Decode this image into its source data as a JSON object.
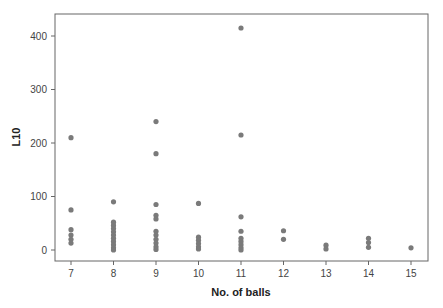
{
  "chart_data": {
    "type": "scatter",
    "title": "",
    "xlabel": "No. of balls",
    "ylabel": "L10",
    "xlim": [
      6.6,
      15.4
    ],
    "ylim": [
      -20,
      440
    ],
    "x_ticks": [
      7,
      8,
      9,
      10,
      11,
      12,
      13,
      14,
      15
    ],
    "y_ticks": [
      0,
      100,
      200,
      300,
      400
    ],
    "grid": false,
    "legend": null,
    "marker_color": "#7a7a7a",
    "series": [
      {
        "name": "L10",
        "points": [
          {
            "x": 7,
            "y": 210
          },
          {
            "x": 7,
            "y": 75
          },
          {
            "x": 7,
            "y": 38
          },
          {
            "x": 7,
            "y": 28
          },
          {
            "x": 7,
            "y": 20
          },
          {
            "x": 7,
            "y": 13
          },
          {
            "x": 8,
            "y": 90
          },
          {
            "x": 8,
            "y": 52
          },
          {
            "x": 8,
            "y": 46
          },
          {
            "x": 8,
            "y": 40
          },
          {
            "x": 8,
            "y": 34
          },
          {
            "x": 8,
            "y": 28
          },
          {
            "x": 8,
            "y": 22
          },
          {
            "x": 8,
            "y": 16
          },
          {
            "x": 8,
            "y": 10
          },
          {
            "x": 8,
            "y": 4
          },
          {
            "x": 8,
            "y": 0
          },
          {
            "x": 9,
            "y": 240
          },
          {
            "x": 9,
            "y": 180
          },
          {
            "x": 9,
            "y": 85
          },
          {
            "x": 9,
            "y": 65
          },
          {
            "x": 9,
            "y": 58
          },
          {
            "x": 9,
            "y": 35
          },
          {
            "x": 9,
            "y": 28
          },
          {
            "x": 9,
            "y": 20
          },
          {
            "x": 9,
            "y": 13
          },
          {
            "x": 9,
            "y": 6
          },
          {
            "x": 9,
            "y": 1
          },
          {
            "x": 10,
            "y": 87
          },
          {
            "x": 10,
            "y": 24
          },
          {
            "x": 10,
            "y": 18
          },
          {
            "x": 10,
            "y": 12
          },
          {
            "x": 10,
            "y": 6
          },
          {
            "x": 10,
            "y": 2
          },
          {
            "x": 11,
            "y": 415
          },
          {
            "x": 11,
            "y": 215
          },
          {
            "x": 11,
            "y": 62
          },
          {
            "x": 11,
            "y": 35
          },
          {
            "x": 11,
            "y": 22
          },
          {
            "x": 11,
            "y": 16
          },
          {
            "x": 11,
            "y": 10
          },
          {
            "x": 11,
            "y": 4
          },
          {
            "x": 11,
            "y": 0
          },
          {
            "x": 12,
            "y": 36
          },
          {
            "x": 12,
            "y": 20
          },
          {
            "x": 13,
            "y": 9
          },
          {
            "x": 13,
            "y": 2
          },
          {
            "x": 14,
            "y": 22
          },
          {
            "x": 14,
            "y": 14
          },
          {
            "x": 14,
            "y": 5
          },
          {
            "x": 15,
            "y": 4
          }
        ]
      }
    ]
  },
  "axes": {
    "x_title": "No. of balls",
    "y_title": "L10",
    "x_tick_labels": [
      "7",
      "8",
      "9",
      "10",
      "11",
      "12",
      "13",
      "14",
      "15"
    ],
    "y_tick_labels": [
      "0",
      "100",
      "200",
      "300",
      "400"
    ]
  }
}
